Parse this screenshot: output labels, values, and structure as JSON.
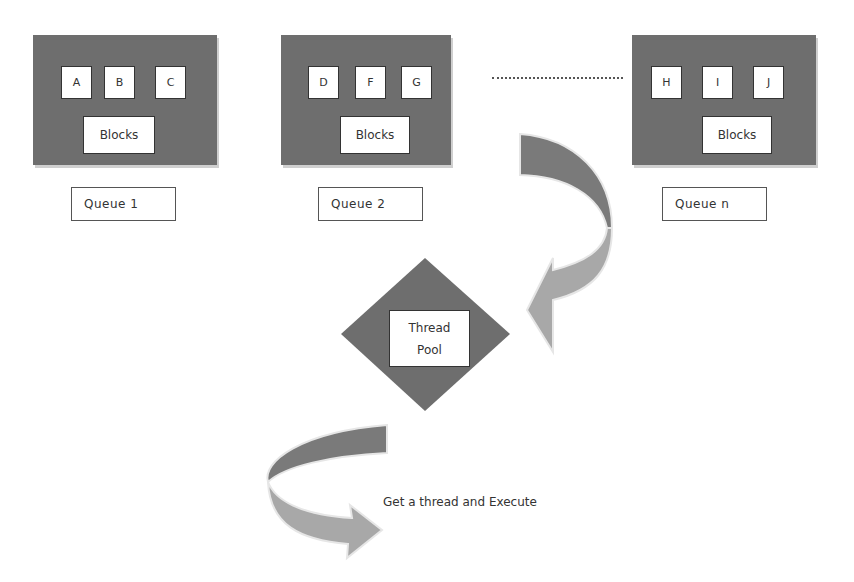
{
  "queues": [
    {
      "label": "Queue 1",
      "items": [
        "A",
        "B",
        "C"
      ],
      "blocks_label": "Blocks"
    },
    {
      "label": "Queue 2",
      "items": [
        "D",
        "F",
        "G"
      ],
      "blocks_label": "Blocks"
    },
    {
      "label": "Queue n",
      "items": [
        "H",
        "I",
        "J"
      ],
      "blocks_label": "Blocks"
    }
  ],
  "thread_pool": {
    "line1": "Thread",
    "line2": "Pool"
  },
  "caption": "Get a thread and Execute",
  "colors": {
    "queue_fill": "#6e6e6e",
    "diamond_fill": "#6e6e6e",
    "arrow_dark": "#7a7a7a",
    "arrow_light": "#a8a8a8"
  }
}
